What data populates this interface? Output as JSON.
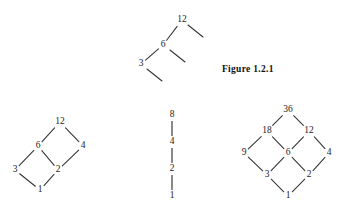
{
  "figure": {
    "caption": "Figure 1.2.1",
    "caption_x": 222,
    "caption_y": 64,
    "stroke_color": "#333333",
    "label_color": "#222222",
    "background_color": "#ffffff"
  },
  "chart_data": {
    "type": "diagram",
    "title": "Figure 1.2.1",
    "subtype": "hasse-diagrams-of-divisibility-posets",
    "diagrams": [
      {
        "id": "partial-chain-top",
        "name": "partial divisor diagram of 12 with open edges",
        "nodes": [
          {
            "id": "n12",
            "label": "12",
            "x": 182,
            "y": 20
          },
          {
            "id": "n6",
            "label": "6",
            "x": 163,
            "y": 45
          },
          {
            "id": "n3",
            "label": "3",
            "x": 141,
            "y": 64
          }
        ],
        "edges": [
          {
            "from": "n12",
            "to": "n6"
          },
          {
            "from": "n6",
            "to": "n3"
          }
        ],
        "open_edges": [
          {
            "from": "n12",
            "x1": 188,
            "y1": 25,
            "x2": 203,
            "y2": 37
          },
          {
            "from": "n6",
            "x1": 170,
            "y1": 50,
            "x2": 185,
            "y2": 62
          },
          {
            "from": "n3",
            "x1": 147,
            "y1": 69,
            "x2": 162,
            "y2": 81
          }
        ]
      },
      {
        "id": "divisors-of-12",
        "name": "divisor lattice of 12",
        "nodes": [
          {
            "id": "d1",
            "label": "1",
            "x": 40,
            "y": 190
          },
          {
            "id": "d3",
            "label": "3",
            "x": 15,
            "y": 170
          },
          {
            "id": "d2",
            "label": "2",
            "x": 58,
            "y": 170
          },
          {
            "id": "d6",
            "label": "6",
            "x": 38,
            "y": 146
          },
          {
            "id": "d4",
            "label": "4",
            "x": 83,
            "y": 146
          },
          {
            "id": "d12",
            "label": "12",
            "x": 60,
            "y": 122
          }
        ],
        "edges": [
          {
            "from": "d1",
            "to": "d3"
          },
          {
            "from": "d1",
            "to": "d2"
          },
          {
            "from": "d3",
            "to": "d6"
          },
          {
            "from": "d2",
            "to": "d6"
          },
          {
            "from": "d2",
            "to": "d4"
          },
          {
            "from": "d6",
            "to": "d12"
          },
          {
            "from": "d4",
            "to": "d12"
          }
        ]
      },
      {
        "id": "divisors-of-8",
        "name": "divisor chain of 8",
        "nodes": [
          {
            "id": "c1",
            "label": "1",
            "x": 172,
            "y": 196
          },
          {
            "id": "c2",
            "label": "2",
            "x": 172,
            "y": 169
          },
          {
            "id": "c4",
            "label": "4",
            "x": 172,
            "y": 142
          },
          {
            "id": "c8",
            "label": "8",
            "x": 172,
            "y": 115
          }
        ],
        "edges": [
          {
            "from": "c1",
            "to": "c2"
          },
          {
            "from": "c2",
            "to": "c4"
          },
          {
            "from": "c4",
            "to": "c8"
          }
        ]
      },
      {
        "id": "divisors-of-36",
        "name": "divisor lattice of 36",
        "nodes": [
          {
            "id": "e1",
            "label": "1",
            "x": 288,
            "y": 196
          },
          {
            "id": "e3",
            "label": "3",
            "x": 267,
            "y": 175
          },
          {
            "id": "e2",
            "label": "2",
            "x": 309,
            "y": 175
          },
          {
            "id": "e9",
            "label": "9",
            "x": 244,
            "y": 153
          },
          {
            "id": "e6",
            "label": "6",
            "x": 288,
            "y": 153
          },
          {
            "id": "e4",
            "label": "4",
            "x": 329,
            "y": 153
          },
          {
            "id": "e18",
            "label": "18",
            "x": 267,
            "y": 131
          },
          {
            "id": "e12",
            "label": "12",
            "x": 309,
            "y": 131
          },
          {
            "id": "e36",
            "label": "36",
            "x": 288,
            "y": 110
          }
        ],
        "edges": [
          {
            "from": "e1",
            "to": "e3"
          },
          {
            "from": "e1",
            "to": "e2"
          },
          {
            "from": "e3",
            "to": "e9"
          },
          {
            "from": "e3",
            "to": "e6"
          },
          {
            "from": "e2",
            "to": "e6"
          },
          {
            "from": "e2",
            "to": "e4"
          },
          {
            "from": "e9",
            "to": "e18"
          },
          {
            "from": "e6",
            "to": "e18"
          },
          {
            "from": "e6",
            "to": "e12"
          },
          {
            "from": "e4",
            "to": "e12"
          },
          {
            "from": "e18",
            "to": "e36"
          },
          {
            "from": "e12",
            "to": "e36"
          }
        ]
      }
    ]
  }
}
